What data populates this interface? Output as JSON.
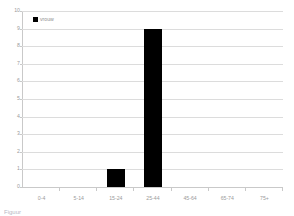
{
  "chart_data": {
    "type": "bar",
    "title": "",
    "xlabel": "",
    "ylabel": "",
    "categories": [
      "0-4",
      "5-14",
      "15-24",
      "25-44",
      "45-64",
      "65-74",
      "75+"
    ],
    "series": [
      {
        "name": "vrouw",
        "values": [
          0,
          0,
          1,
          9,
          0,
          0,
          0
        ],
        "color": "#000000"
      }
    ],
    "ylim": [
      0,
      10
    ],
    "yticks": [
      0,
      1,
      2,
      3,
      4,
      5,
      6,
      7,
      8,
      9,
      10
    ],
    "ytick_labels": [
      "0",
      "1",
      "2",
      "3",
      "4",
      "5",
      "6",
      "7",
      "8",
      "9",
      "10"
    ],
    "grid": true,
    "grid_axis": "y",
    "legend": {
      "position": "top-left-inside",
      "entries": [
        {
          "label": "vrouw",
          "color": "#000000",
          "marker": "square"
        }
      ]
    },
    "colors": {
      "bar": "#000000",
      "gridline": "#dcdcdc",
      "axis": "#c9c9c9",
      "tick_text": "#9b9b9b",
      "background": "#ffffff"
    }
  },
  "caption": {
    "text": "Figuur"
  }
}
